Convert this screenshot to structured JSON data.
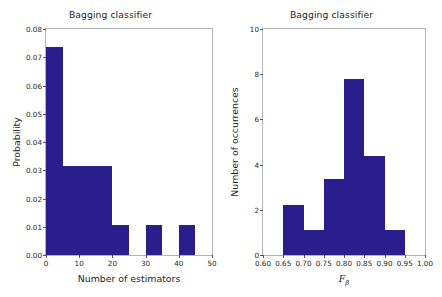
{
  "figure": {
    "background": "#ffffff",
    "bar_color": "#2b1d8c",
    "axis_color": "#b4b4b4"
  },
  "chart_data": [
    {
      "type": "bar",
      "id": "estimators-histogram",
      "title": "Bagging classifier",
      "xlabel": "Number of estimators",
      "ylabel": "Probability",
      "xlim": [
        0,
        50
      ],
      "ylim": [
        0,
        0.08
      ],
      "grid": false,
      "legend": null,
      "xticks": [
        0,
        10,
        20,
        30,
        40,
        50
      ],
      "xticklabels": [
        "0",
        "10",
        "20",
        "30",
        "40",
        "50"
      ],
      "yticks": [
        0.0,
        0.01,
        0.02,
        0.03,
        0.04,
        0.05,
        0.06,
        0.07,
        0.08
      ],
      "yticklabels": [
        "0.00",
        "0.01",
        "0.02",
        "0.03",
        "0.04",
        "0.05",
        "0.06",
        "0.07",
        "0.08"
      ],
      "bin_edges": [
        0,
        5,
        10,
        15,
        20,
        25,
        30,
        35,
        40,
        45,
        50
      ],
      "categories": [
        "0-5",
        "5-10",
        "10-15",
        "15-20",
        "20-25",
        "25-30",
        "30-35",
        "35-40",
        "40-45",
        "45-50"
      ],
      "values": [
        0.0738,
        0.0316,
        0.0316,
        0.0316,
        0.0105,
        0.0,
        0.0105,
        0.0,
        0.0105,
        0.0
      ]
    },
    {
      "type": "bar",
      "id": "fbeta-histogram",
      "title": "Bagging classifier",
      "xlabel": "F",
      "xlabel_sub": "β",
      "ylabel": "Number of occurrences",
      "xlim": [
        0.6,
        1.0
      ],
      "ylim": [
        0,
        10
      ],
      "grid": false,
      "legend": null,
      "xticks": [
        0.6,
        0.65,
        0.7,
        0.75,
        0.8,
        0.85,
        0.9,
        0.95,
        1.0
      ],
      "xticklabels": [
        "0.60",
        "0.65",
        "0.70",
        "0.75",
        "0.80",
        "0.85",
        "0.90",
        "0.95",
        "1.00"
      ],
      "yticks": [
        0,
        2,
        4,
        6,
        8,
        10
      ],
      "yticklabels": [
        "0",
        "2",
        "4",
        "6",
        "8",
        "10"
      ],
      "bin_edges": [
        0.6,
        0.65,
        0.7,
        0.75,
        0.8,
        0.85,
        0.9,
        0.95,
        1.0
      ],
      "categories": [
        "0.60-0.65",
        "0.65-0.70",
        "0.70-0.75",
        "0.75-0.80",
        "0.80-0.85",
        "0.85-0.90",
        "0.90-0.95",
        "0.95-1.00"
      ],
      "values": [
        0.0,
        2.2,
        1.1,
        3.35,
        7.8,
        4.4,
        1.1,
        0.0
      ]
    }
  ]
}
